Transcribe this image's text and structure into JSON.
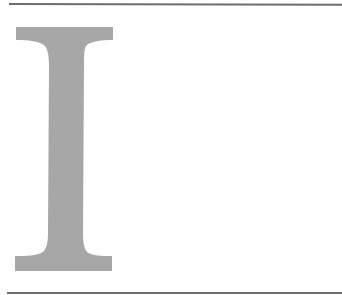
{
  "document": {
    "drop_cap_letter": "I",
    "drop_cap_color": "#a7a7a7",
    "rule_color": "#6e6e6e"
  }
}
